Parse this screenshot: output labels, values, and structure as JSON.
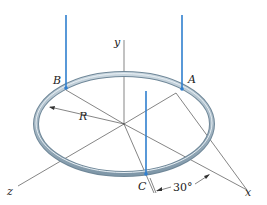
{
  "diagram": {
    "labels": {
      "y_axis": "y",
      "x_axis": "x",
      "z_axis": "z",
      "point_a": "A",
      "point_b": "B",
      "point_c": "C",
      "radius": "R",
      "angle": "30°"
    },
    "colors": {
      "cable": "#2f7fcf",
      "ring": "#9fb4c4",
      "axis": "#333333"
    }
  }
}
